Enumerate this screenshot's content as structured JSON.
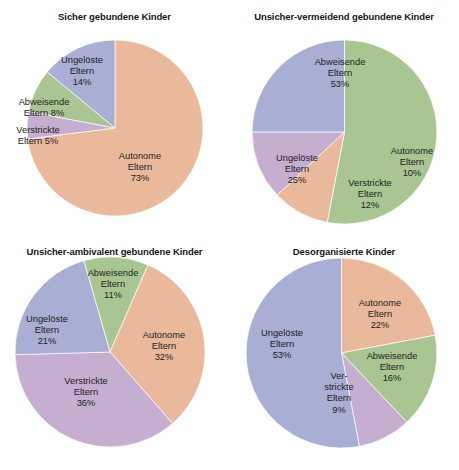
{
  "figure": {
    "background": "#ffffff",
    "panels": [
      {
        "id": "secure",
        "title": "Sicher gebundene Kinder",
        "labels": [
          {
            "name": "autonome",
            "text": "Autonome\nEltern\n73%",
            "x": 140,
            "y": 168
          },
          {
            "name": "ungeloeste",
            "text": "Ungelöste\nEltern\n14%",
            "x": 82,
            "y": 72
          },
          {
            "name": "abweisende",
            "text": "Abweisende\nEltern 8%",
            "x": 44,
            "y": 108
          },
          {
            "name": "verstrickte",
            "text": "Verstrickte\nEltern 5%",
            "x": 38,
            "y": 136
          }
        ]
      },
      {
        "id": "avoidant",
        "title": "Unsicher-vermeidend gebundene Kinder",
        "labels": [
          {
            "name": "abweisende",
            "text": "Abweisende\nEltern\n53%",
            "x": 111,
            "y": 74
          },
          {
            "name": "ungeloeste",
            "text": "Ungelöste\nEltern\n25%",
            "x": 68,
            "y": 170
          },
          {
            "name": "verstrickte",
            "text": "Verstrickte\nEltern\n12%",
            "x": 141,
            "y": 195
          },
          {
            "name": "autonome",
            "text": "Autonome\nEltern\n10%",
            "x": 183,
            "y": 163
          }
        ]
      },
      {
        "id": "ambivalent",
        "title": "Unsicher-ambivalent gebundene Kinder",
        "labels": [
          {
            "name": "abweisende",
            "text": "Abweisende\nEltern\n11%",
            "x": 113,
            "y": 50
          },
          {
            "name": "autonome",
            "text": "Autonome\nEltern\n32%",
            "x": 164,
            "y": 112
          },
          {
            "name": "verstrickte",
            "text": "Verstrickte\nEltern\n36%",
            "x": 86,
            "y": 158
          },
          {
            "name": "ungeloeste",
            "text": "Ungelöste\nEltern\n21%",
            "x": 47,
            "y": 96
          }
        ]
      },
      {
        "id": "disorganized",
        "title": "Desorganisierte Kinder",
        "labels": [
          {
            "name": "autonome",
            "text": "Autonome\nEltern\n22%",
            "x": 151,
            "y": 80
          },
          {
            "name": "abweisende",
            "text": "Abweisende\nEltern\n16%",
            "x": 163,
            "y": 133
          },
          {
            "name": "verstrickte",
            "text": "Ver-\nstrickte\nEltern\n9%",
            "x": 110,
            "y": 158
          },
          {
            "name": "ungeloeste",
            "text": "Ungelöste\nEltern\n53%",
            "x": 53,
            "y": 110
          }
        ]
      }
    ]
  },
  "colors": {
    "autonome": "#eab99b",
    "abweisende": "#a9c592",
    "verstrickte": "#c6aed0",
    "ungeloeste": "#a9aed4",
    "edge": "#ffffff",
    "text": "#1d1d22",
    "title": "#17171a"
  },
  "chart_data": [
    {
      "type": "pie",
      "title": "Sicher gebundene Kinder",
      "categories": [
        "Autonome Eltern",
        "Verstrickte Eltern",
        "Abweisende Eltern",
        "Ungelöste Eltern"
      ],
      "values": [
        73,
        5,
        8,
        14
      ],
      "unit": "%",
      "colors": [
        "#eab99b",
        "#c6aed0",
        "#a9c592",
        "#a9aed4"
      ],
      "start_angle_deg": 0,
      "direction": "clockwise",
      "center": [
        115,
        128
      ],
      "radius": 88,
      "legend": "none",
      "grid": false,
      "labels_inside": true
    },
    {
      "type": "pie",
      "title": "Unsicher-vermeidend gebundene Kinder",
      "categories": [
        "Abweisende Eltern",
        "Autonome Eltern",
        "Verstrickte Eltern",
        "Ungelöste Eltern"
      ],
      "values": [
        53,
        10,
        12,
        25
      ],
      "unit": "%",
      "colors": [
        "#a9c592",
        "#eab99b",
        "#c6aed0",
        "#a9aed4"
      ],
      "start_angle_deg": 0,
      "direction": "clockwise",
      "center": [
        115,
        132
      ],
      "radius": 92,
      "legend": "none",
      "grid": false,
      "labels_inside": true
    },
    {
      "type": "pie",
      "title": "Unsicher-ambivalent gebundene Kinder",
      "categories": [
        "Abweisende Eltern",
        "Autonome Eltern",
        "Verstrickte Eltern",
        "Ungelöste Eltern"
      ],
      "values": [
        11,
        32,
        36,
        21
      ],
      "unit": "%",
      "colors": [
        "#a9c592",
        "#eab99b",
        "#c6aed0",
        "#a9aed4"
      ],
      "start_angle_deg": -16,
      "direction": "clockwise",
      "center": [
        110,
        117
      ],
      "radius": 95,
      "legend": "none",
      "grid": false,
      "labels_inside": true
    },
    {
      "type": "pie",
      "title": "Desorganisierte Kinder",
      "categories": [
        "Autonome Eltern",
        "Abweisende Eltern",
        "Verstrickte Eltern",
        "Ungelöste Eltern"
      ],
      "values": [
        22,
        16,
        9,
        53
      ],
      "unit": "%",
      "colors": [
        "#eab99b",
        "#a9c592",
        "#c6aed0",
        "#a9aed4"
      ],
      "start_angle_deg": 0,
      "direction": "clockwise",
      "center": [
        112,
        118
      ],
      "radius": 95,
      "legend": "none",
      "grid": false,
      "labels_inside": true
    }
  ]
}
